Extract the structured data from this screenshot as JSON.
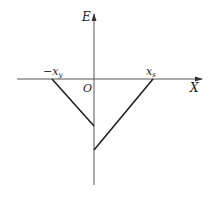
{
  "diagram": {
    "axes": {
      "y_label": "E",
      "x_label": "X",
      "origin_label": "O"
    },
    "points": {
      "left_intercept": {
        "text": "−x",
        "sub": "y"
      },
      "right_intercept": {
        "text": "x",
        "sub": "s"
      }
    },
    "colors": {
      "line": "#222222",
      "axis": "#555555"
    }
  }
}
